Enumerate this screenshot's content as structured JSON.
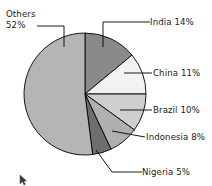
{
  "chart_data": {
    "type": "pie",
    "title": "",
    "subtitle": "",
    "xlabel": "",
    "ylabel": "",
    "grid": false,
    "legend_position": "none",
    "label_style": "callout-with-leader-lines",
    "start_angle_deg": 0,
    "direction": "clockwise",
    "categories": [
      "India",
      "China",
      "Brazil",
      "Indonesia",
      "Nigeria",
      "Others"
    ],
    "values": [
      14,
      11,
      10,
      8,
      5,
      52
    ],
    "unit": "%",
    "total": 100,
    "slices": [
      {
        "name": "India",
        "value": 14,
        "label": "India 14%",
        "color": "#8a8a8a",
        "label_position": "right",
        "start_deg": 0,
        "end_deg": 50.4
      },
      {
        "name": "China",
        "value": 11,
        "label": "China 11%",
        "color": "#f2f2f2",
        "label_position": "right",
        "start_deg": 50.4,
        "end_deg": 90.0
      },
      {
        "name": "Brazil",
        "value": 10,
        "label": "Brazil 10%",
        "color": "#cfcfcf",
        "label_position": "right",
        "start_deg": 90.0,
        "end_deg": 126.0
      },
      {
        "name": "Indonesia",
        "value": 8,
        "label": "Indonesia 8%",
        "color": "#b0b0b0",
        "label_position": "right",
        "start_deg": 126.0,
        "end_deg": 154.8
      },
      {
        "name": "Nigeria",
        "value": 5,
        "label": "Nigeria 5%",
        "color": "#6e6e6e",
        "label_position": "bottom-right",
        "start_deg": 154.8,
        "end_deg": 172.8
      },
      {
        "name": "Others",
        "value": 52,
        "label": "Others 52%",
        "name_line": "Others",
        "value_line": "52%",
        "color": "#b5b5b5",
        "label_position": "top-left",
        "start_deg": 172.8,
        "end_deg": 360.0
      }
    ]
  },
  "labels": {
    "india": "India 14%",
    "china": "China 11%",
    "brazil": "Brazil 10%",
    "indonesia": "Indonesia 8%",
    "nigeria": "Nigeria 5%",
    "others_name": "Others",
    "others_value": "52%"
  },
  "colors": {
    "india": "#8a8a8a",
    "china": "#f2f2f2",
    "brazil": "#cfcfcf",
    "indonesia": "#b0b0b0",
    "nigeria": "#6e6e6e",
    "others": "#b5b5b5",
    "outline": "#000000",
    "text": "#1a1a1a",
    "background": "#ffffff"
  }
}
